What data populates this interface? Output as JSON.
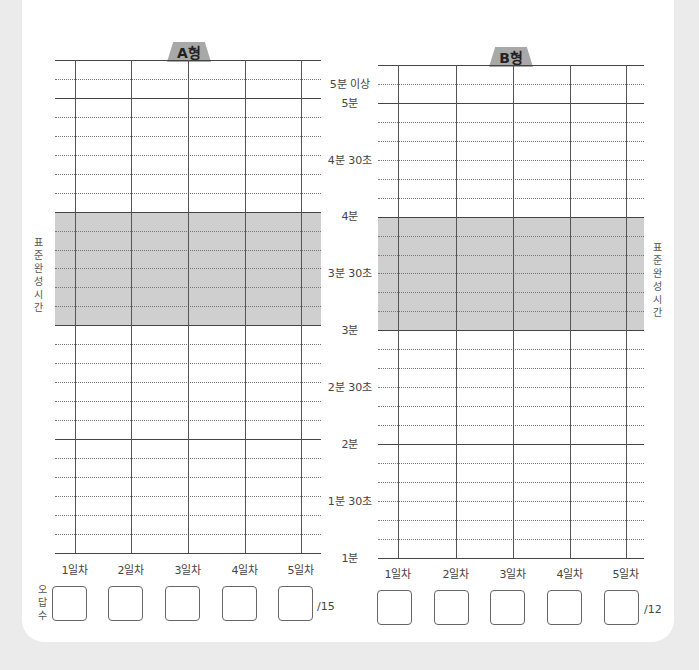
{
  "chart_data": [
    {
      "type": "table",
      "title": "A형",
      "categories": [
        "1일차",
        "2일차",
        "3일차",
        "4일차",
        "5일차"
      ],
      "y_tick_labels": [
        "5분 이상",
        "5분",
        "4분 30초",
        "4분",
        "3분 30초",
        "3분",
        "2분 30초",
        "2분",
        "1분 30초",
        "1분"
      ],
      "shaded_band": {
        "label": "표준완성시간",
        "from": "3분",
        "to": "4분"
      },
      "grid": true,
      "values": [
        null,
        null,
        null,
        null,
        null
      ],
      "wrong_answers_label": "오답수",
      "wrong_answers_total": "/15"
    },
    {
      "type": "table",
      "title": "B형",
      "categories": [
        "1일차",
        "2일차",
        "3일차",
        "4일차",
        "5일차"
      ],
      "y_tick_labels": [
        "5분 이상",
        "5분",
        "4분 30초",
        "4분",
        "3분 30초",
        "3분",
        "2분 30초",
        "2분",
        "1분 30초",
        "1분"
      ],
      "shaded_band": {
        "label": "표준완성시간",
        "from": "3분",
        "to": "4분"
      },
      "grid": true,
      "values": [
        null,
        null,
        null,
        null,
        null
      ],
      "wrong_answers_total": "/12"
    }
  ],
  "chartA": {
    "tab": "A형",
    "band_label": "표준완성시간",
    "days": [
      "1일차",
      "2일차",
      "3일차",
      "4일차",
      "5일차"
    ],
    "wrong_label": "오답수",
    "total": "/15"
  },
  "chartB": {
    "tab": "B형",
    "band_label": "표준완성시간",
    "days": [
      "1일차",
      "2일차",
      "3일차",
      "4일차",
      "5일차"
    ],
    "total": "/12"
  },
  "yaxis": {
    "labels": [
      "5분 이상",
      "5분",
      "4분 30초",
      "4분",
      "3분 30초",
      "3분",
      "2분 30초",
      "2분",
      "1분 30초",
      "1분"
    ]
  }
}
